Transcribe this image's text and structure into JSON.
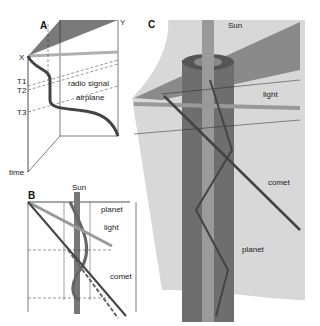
{
  "panels": {
    "A": {
      "letter": "A",
      "labels": {
        "x": "X",
        "y": "Y",
        "t1": "T1",
        "t2": "T2",
        "t3": "T3",
        "time": "time",
        "radio": "radio signal",
        "airplane": "airplane"
      }
    },
    "B": {
      "letter": "B",
      "labels": {
        "sun": "Sun",
        "planet": "planet",
        "light": "light",
        "comet": "comet"
      }
    },
    "C": {
      "letter": "C",
      "labels": {
        "sun": "Sun",
        "light": "light",
        "comet": "comet",
        "planet": "planet"
      }
    }
  },
  "colors": {
    "dark": "#555555",
    "mid": "#8a8a8a",
    "light": "#c8c8c8",
    "pale": "#e2e2e2",
    "line": "#222222"
  }
}
